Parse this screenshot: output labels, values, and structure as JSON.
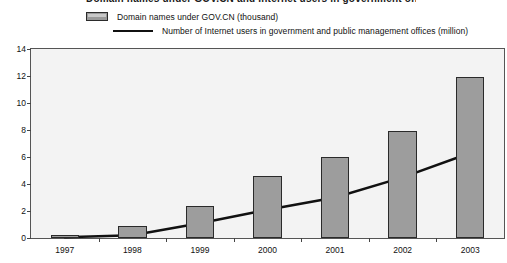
{
  "title": "Domain names under GOV.CN and Internet users in government offices",
  "legend": [
    {
      "label": "Domain names under GOV.CN (thousand)",
      "marker": "bar-swatch",
      "color": "#9d9d9d"
    },
    {
      "label": "Number of Internet users in government and public management offices (million)",
      "marker": "line-swatch",
      "color": "#111111"
    }
  ],
  "axis": {
    "y_ticks": [
      "14",
      "12",
      "10",
      "8",
      "6",
      "4",
      "2",
      "0"
    ],
    "x_ticks": [
      "1997",
      "1998",
      "1999",
      "2000",
      "2001",
      "2002",
      "2003"
    ]
  },
  "chart_data": {
    "type": "bar",
    "title": "Domain names under GOV.CN and Internet users in government offices",
    "xlabel": "",
    "ylabel": "",
    "ylim": [
      0,
      14
    ],
    "ytick_step": 2,
    "grid": false,
    "legend_position": "top-left",
    "categories": [
      "1997",
      "1998",
      "1999",
      "2000",
      "2001",
      "2002",
      "2003"
    ],
    "series": [
      {
        "name": "Domain names under GOV.CN (thousand)",
        "type": "bar",
        "color": "#9d9d9d",
        "values": [
          0.2,
          0.9,
          2.4,
          4.6,
          6.0,
          7.9,
          11.9
        ]
      },
      {
        "name": "Number of Internet users in government and public management offices (million)",
        "type": "line",
        "color": "#111111",
        "values": [
          0.05,
          0.2,
          1.1,
          2.1,
          3.0,
          4.5,
          6.3
        ]
      }
    ]
  }
}
